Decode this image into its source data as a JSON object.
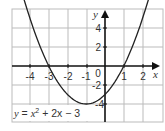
{
  "chart_data": {
    "type": "line",
    "title": "",
    "equation": "y = x² + 2x − 3",
    "equation_parts": {
      "lhs": "y",
      "eq": " = ",
      "x": "x",
      "exp": "2",
      "rest": " + 2x − 3"
    },
    "xlabel": "x",
    "ylabel": "y",
    "xlim": [
      -5,
      3
    ],
    "ylim": [
      -6,
      6
    ],
    "grid": true,
    "x_ticks": [
      "-4",
      "-3",
      "-2",
      "-1",
      "0",
      "1",
      "2"
    ],
    "y_ticks": [
      "4",
      "2",
      "-2",
      "-4"
    ],
    "origin_label": "0",
    "series": [
      {
        "name": "y = x^2 + 2x - 3",
        "x": [
          -4.6,
          -4,
          -3.5,
          -3,
          -2.5,
          -2,
          -1.5,
          -1,
          -0.5,
          0,
          0.5,
          1,
          1.5,
          2,
          2.6
        ],
        "values": [
          8.96,
          5,
          2.25,
          0,
          -1.75,
          -3,
          -3.75,
          -4,
          -3.75,
          -3,
          -1.75,
          0,
          2.25,
          5,
          8.96
        ]
      }
    ],
    "key_points": {
      "roots": [
        -3,
        1
      ],
      "vertex": [
        -1,
        -4
      ],
      "y_intercept": -3
    },
    "colors": {
      "curve": "#222222",
      "grid": "#bbbbbb",
      "axes": "#111111"
    }
  }
}
